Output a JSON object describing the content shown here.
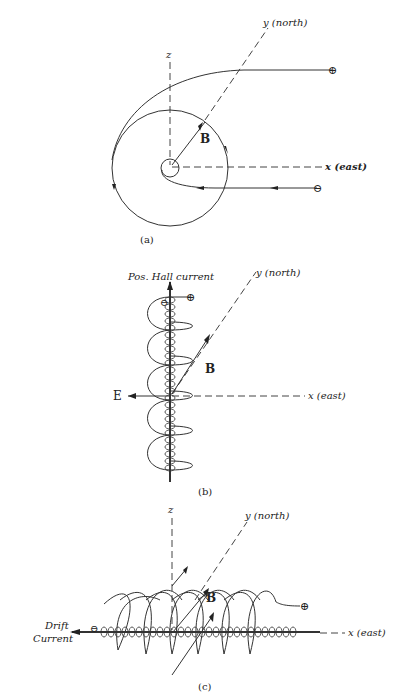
{
  "figure": {
    "panels": [
      {
        "id": "a",
        "caption": "(a)",
        "axes": {
          "z": "z",
          "y": "y (north)",
          "x": "x (east)"
        },
        "field_label": "B",
        "charges": {
          "positive": "⊕",
          "negative": "⊖"
        }
      },
      {
        "id": "b",
        "caption": "(b)",
        "axes": {
          "y": "y (north)",
          "x": "x (east)"
        },
        "field_label": "B",
        "electric_field_label": "E",
        "current_label": "Pos. Hall current",
        "charges": {
          "positive": "⊕",
          "negative": "⊖"
        }
      },
      {
        "id": "c",
        "caption": "(c)",
        "axes": {
          "z": "z",
          "y": "y (north)",
          "x": "x (east)"
        },
        "field_label": "B",
        "current_label_line1": "Drift",
        "current_label_line2": "Current",
        "charges": {
          "positive": "⊕",
          "negative": "⊖"
        }
      }
    ]
  }
}
